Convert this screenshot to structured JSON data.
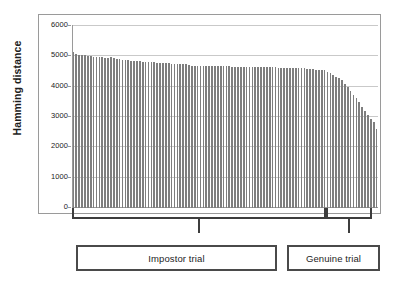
{
  "chart_data": {
    "type": "bar",
    "title": "",
    "xlabel": "",
    "ylabel": "Hamming distance",
    "ylim": [
      0,
      6000
    ],
    "yticks": [
      0,
      1000,
      2000,
      3000,
      4000,
      5000,
      6000
    ],
    "ytick_labels": [
      "0",
      "1000",
      "2000",
      "3000",
      "4000",
      "5000",
      "6000"
    ],
    "grid": true,
    "legend": "none",
    "bar_color": "#7e7e7e",
    "series_name": "Hamming distance per trial",
    "x_count": 104,
    "values": [
      5150,
      5090,
      5060,
      5040,
      5030,
      5015,
      5000,
      4990,
      4985,
      4995,
      4970,
      4960,
      4955,
      4965,
      4930,
      4915,
      4900,
      4890,
      4880,
      4870,
      4860,
      4850,
      4845,
      4840,
      4830,
      4820,
      4815,
      4810,
      4800,
      4795,
      4790,
      4780,
      4775,
      4770,
      4760,
      4755,
      4750,
      4745,
      4740,
      4735,
      4700,
      4695,
      4690,
      4688,
      4686,
      4684,
      4682,
      4680,
      4678,
      4676,
      4674,
      4672,
      4670,
      4668,
      4666,
      4664,
      4662,
      4660,
      4658,
      4656,
      4654,
      4652,
      4650,
      4648,
      4646,
      4644,
      4642,
      4640,
      4638,
      4636,
      4634,
      4632,
      4630,
      4628,
      4626,
      4624,
      4622,
      4620,
      4615,
      4610,
      4600,
      4590,
      4580,
      4570,
      4560,
      4550,
      4545,
      4540,
      4500,
      4440,
      4380,
      4330,
      4280,
      4230,
      4100,
      3980,
      3860,
      3740,
      3620,
      3480,
      3340,
      3200,
      3060,
      2920,
      2850,
      2620
    ],
    "annotations": [
      {
        "name": "impostor-trial",
        "label": "Impostor trial",
        "start_index": 0,
        "end_index": 87
      },
      {
        "name": "genuine-trial",
        "label": "Genuine trial",
        "start_index": 88,
        "end_index": 103
      }
    ]
  },
  "labels": {
    "impostor": "Impostor trial",
    "genuine": "Genuine trial"
  },
  "colors": {
    "bar": "#7e7e7e",
    "grid": "#c9c9c9",
    "frame": "#9a9a9a",
    "brace": "#3d3d3d",
    "box_border": "#4a4a4a",
    "text": "#1d1d1d"
  }
}
